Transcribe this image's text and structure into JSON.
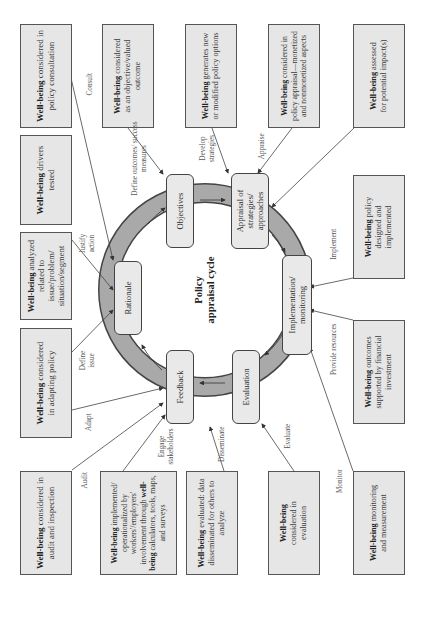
{
  "diagram": {
    "orientation": "rotated 90 degrees counterclockwise",
    "center_title": {
      "line1": "Policy",
      "line2": "appraisal cycle"
    },
    "cycle_nodes": [
      {
        "id": "objectives",
        "label": "Objectives"
      },
      {
        "id": "appraisal",
        "label_lines": [
          "Appraisal of",
          "strategies/",
          "approaches"
        ]
      },
      {
        "id": "implementation",
        "label_lines": [
          "Implementation/",
          "monitoring"
        ]
      },
      {
        "id": "evaluation",
        "label": "Evaluation"
      },
      {
        "id": "feedback",
        "label": "Feedback"
      },
      {
        "id": "rationale",
        "label": "Rationale"
      }
    ],
    "wellbeing_boxes": [
      {
        "id": "consultation",
        "bold": "Well-being",
        "rest": " considered in policy consultation",
        "link_label": "Consult",
        "target": "objectives"
      },
      {
        "id": "objective-outcome",
        "bold": "Well-being",
        "rest": " considered as an objective/valued outcome",
        "link_label": "Define outcomes/ success measures",
        "target": "objectives"
      },
      {
        "id": "generates-options",
        "bold": "Well-being",
        "rest": " generates new or modified policy options",
        "link_label": "Develop strategies",
        "target": "appraisal"
      },
      {
        "id": "policy-appraisal",
        "bold": "Well-being",
        "rest": " considered in policy appraisal—monetized and nonmonetized aspects",
        "link_label": "Appraise",
        "target": "appraisal"
      },
      {
        "id": "assessed-impacts",
        "bold": "Well-being",
        "rest": " assessed for potential impact(s)",
        "link_label": "",
        "target": "appraisal"
      },
      {
        "id": "designed-implemented",
        "bold": "Well-being",
        "rest": " policy designed and implemented",
        "link_label": "Implement",
        "target": "implementation"
      },
      {
        "id": "financial-investment",
        "bold": "Well-being",
        "rest": " outcomes supported by financial investment",
        "link_label": "Provide resources",
        "target": "implementation"
      },
      {
        "id": "monitoring-measurement",
        "bold": "Well-being",
        "rest": " monitoring and measurement",
        "link_label": "Monitor",
        "target": "implementation"
      },
      {
        "id": "considered-evaluation",
        "bold": "Well-being",
        "rest": " considered in evaluation",
        "link_label": "Evaluate",
        "target": "evaluation"
      },
      {
        "id": "evaluated-data",
        "bold": "Well-being",
        "rest": " evaluated: data disseminated for others to analyze",
        "link_label": "Disseminate",
        "target": "feedback"
      },
      {
        "id": "operationalized",
        "bold": "Well-being",
        "rest": " implemented/ operationalized by workers'/employers' involvement through ",
        "bold2": "well-being",
        "rest2": " calculators, tools, maps, and surveys",
        "link_label": "Engage stakeholders",
        "target": "feedback"
      },
      {
        "id": "audit-inspection",
        "bold": "Well-being",
        "rest": " considered in audit and inspection",
        "link_label": "Audit",
        "target": "feedback"
      },
      {
        "id": "adapting-policy",
        "bold": "Well-being",
        "rest": " considered in adapting policy",
        "link_label": "Adapt",
        "target": "feedback"
      },
      {
        "id": "analyzed-issue",
        "bold": "Well-being",
        "rest": " analyzed related to issue/problem/ situation/segment",
        "link_label": "Define issue",
        "target": "rationale"
      },
      {
        "id": "drivers-tested",
        "bold": "Well-being",
        "rest": " drivers tested",
        "link_label": "Justify action",
        "target": "rationale"
      }
    ],
    "colors": {
      "box_fill": "#e6e6e6",
      "box_border": "#555555",
      "ring_fill": "#a9a9a9",
      "node_fill": "#e9e9e9",
      "line": "#444444"
    }
  }
}
